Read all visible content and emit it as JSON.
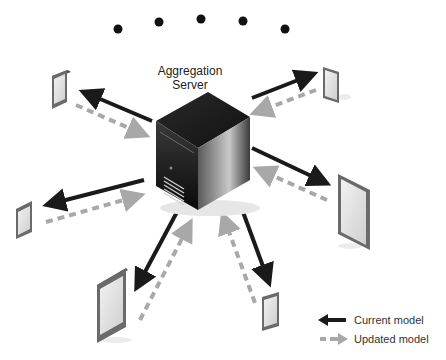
{
  "diagram": {
    "title_line1": "Aggregation",
    "title_line2": "Server",
    "dots_count": 5,
    "devices": [
      {
        "id": "top-left-phone",
        "type": "phone"
      },
      {
        "id": "top-right-phone",
        "type": "phone"
      },
      {
        "id": "left-phone",
        "type": "phone"
      },
      {
        "id": "right-tablet",
        "type": "tablet"
      },
      {
        "id": "bottom-left-tablet",
        "type": "tablet"
      },
      {
        "id": "bottom-right-phone",
        "type": "phone"
      }
    ]
  },
  "legend": {
    "current_label": "Current model",
    "updated_label": "Updated model"
  },
  "colors": {
    "current_arrow": "#1a1a1a",
    "updated_arrow": "#a8a8a8"
  }
}
